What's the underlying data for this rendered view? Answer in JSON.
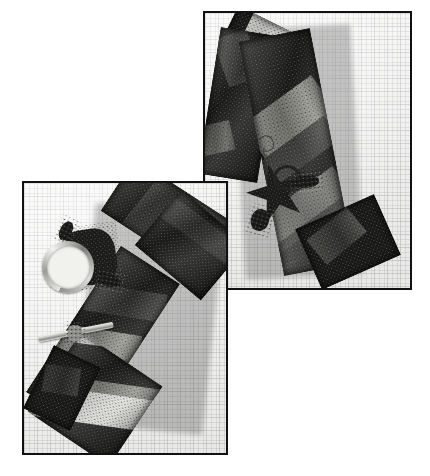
{
  "page": {
    "kind": "photograph",
    "width": 430,
    "height": 476,
    "background_color": "#ffffff",
    "caption": ""
  },
  "palette": {
    "paper_white": "#f6f6f4",
    "grid_line": "#9aa0a6",
    "frame_black": "#111111",
    "bead_black": "#141414",
    "bead_charcoal": "#1b1b1a",
    "bead_dark_gray": "#3a3a37",
    "bead_mid_gray": "#77776f",
    "bead_silver": "#d2d2cf",
    "metal_silver": "#e3e3e0",
    "shadow": "#464646"
  },
  "photos": [
    {
      "id": "photo-upper-right",
      "name": "upper-right-photo",
      "label": "Beaded bracelet with beaded star toggle clasp on graph paper",
      "x": 203,
      "y": 11,
      "width": 209,
      "height": 279,
      "background": "graph-paper",
      "objects": [
        {
          "name": "beaded-bracelet",
          "description": "Wide flat peyote-stitch bracelet band running diagonally from upper-left to lower-right",
          "colors": [
            "black",
            "silver",
            "mid-gray",
            "dark-gray"
          ],
          "pattern": "diagonal-chevron-bands"
        },
        {
          "name": "pointed-end",
          "description": "V-shaped pointed terminal worked in light silver beads"
        },
        {
          "name": "beaded-star-toggle",
          "description": "Five-point beaded star toggle with beaded ring and wire hook"
        },
        {
          "name": "wire-hook",
          "description": "Small S-shaped wire hook attached to the band tip"
        }
      ]
    },
    {
      "id": "photo-lower-left",
      "name": "lower-left-photo",
      "label": "Beaded bracelet with silver toggle ring and bar clasp on graph paper",
      "x": 22,
      "y": 181,
      "width": 206,
      "height": 274,
      "background": "graph-paper",
      "objects": [
        {
          "name": "beaded-bracelet",
          "description": "Wide flat peyote-stitch bracelet band folded, running from upper-right down to lower-left",
          "colors": [
            "black",
            "silver",
            "mid-gray",
            "dark-gray"
          ],
          "pattern": "diagonal-chevron-bands"
        },
        {
          "name": "toggle-ring-clasp",
          "description": "Polished silver round toggle ring"
        },
        {
          "name": "toggle-bar-clasp",
          "description": "Polished silver straight toggle bar"
        },
        {
          "name": "beaded-connector",
          "description": "Small dark beaded tab joining clasp to the band"
        }
      ]
    }
  ]
}
